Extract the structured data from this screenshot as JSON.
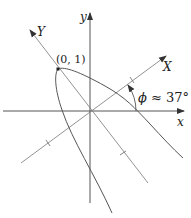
{
  "diagram": {
    "axes": {
      "x_label": "x",
      "y_label": "y",
      "rotated_x_label": "X",
      "rotated_y_label": "Y"
    },
    "point": {
      "label": "(0, 1)"
    },
    "angle": {
      "symbol": "ϕ",
      "relation": "≈",
      "value": "37°"
    },
    "colors": {
      "line": "#555555",
      "text": "#222222",
      "background": "#ffffff"
    }
  }
}
